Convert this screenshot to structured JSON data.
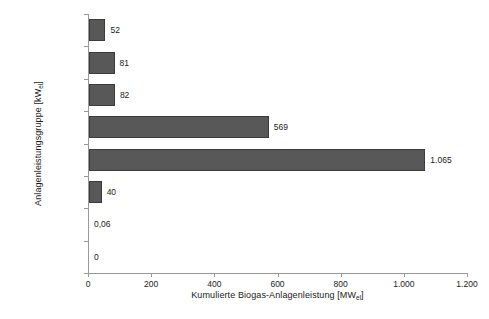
{
  "chart_data": {
    "type": "bar",
    "orientation": "horizontal",
    "title": "",
    "xlabel": "Kumulierte Biogas-Anlagenleistung [MW",
    "xlabel_sub": "el",
    "xlabel_suffix": "]",
    "ylabel": "Anlagenleistungsgruppe [kW",
    "ylabel_sub": "el",
    "ylabel_suffix": "]",
    "categories": [
      "> 2.000",
      "1.000 - 2.000",
      "750 - 1.000",
      "500 - 750",
      "150 - 500",
      "75 - 150",
      "25 - 75",
      "< 25"
    ],
    "values": [
      52,
      81,
      82,
      569,
      1065,
      40,
      0.06,
      0
    ],
    "value_labels": [
      "52",
      "81",
      "82",
      "569",
      "1.065",
      "40",
      "0,06",
      "0"
    ],
    "xlim": [
      0,
      1200
    ],
    "xticks": [
      0,
      200,
      400,
      600,
      800,
      1000,
      1200
    ],
    "xticklabels": [
      "0",
      "200",
      "400",
      "600",
      "800",
      "1.000",
      "1.200"
    ],
    "grid": false,
    "legend": false,
    "bar_color": "#585858",
    "bar_edge_color": "#3b3b3b",
    "axis_color": "#9a9a9a",
    "text_color": "#1a1a1a",
    "background": "#ffffff"
  }
}
